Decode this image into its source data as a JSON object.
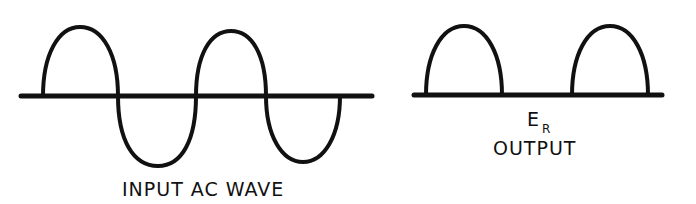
{
  "diagram": {
    "type": "waveform-comparison",
    "stroke_color": "#111111",
    "background": "#ffffff",
    "input": {
      "label": "INPUT AC WAVE",
      "description": "Full sine wave: two positive lobes, two negative lobes"
    },
    "output": {
      "symbol": "E",
      "symbol_subscript": "R",
      "label": "OUTPUT",
      "description": "Half-wave rectified: positive lobes only, flat between"
    }
  }
}
